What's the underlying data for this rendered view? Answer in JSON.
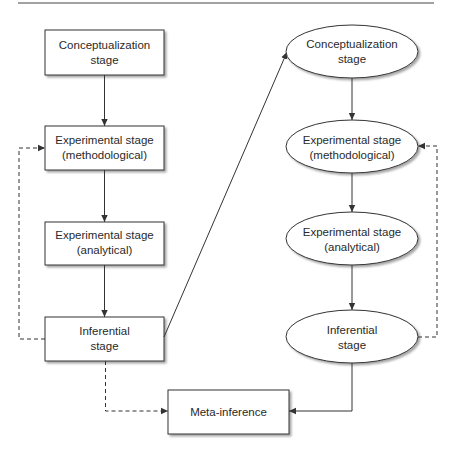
{
  "diagram": {
    "left_column": [
      {
        "line1": "Conceptualization",
        "line2": "stage"
      },
      {
        "line1": "Experimental stage",
        "line2": "(methodological)"
      },
      {
        "line1": "Experimental stage",
        "line2": "(analytical)"
      },
      {
        "line1": "Inferential",
        "line2": "stage"
      }
    ],
    "right_column": [
      {
        "line1": "Conceptualization",
        "line2": "stage"
      },
      {
        "line1": "Experimental stage",
        "line2": "(methodological)"
      },
      {
        "line1": "Experimental stage",
        "line2": "(analytical)"
      },
      {
        "line1": "Inferential",
        "line2": "stage"
      }
    ],
    "meta": {
      "label": "Meta-inference"
    },
    "colors": {
      "stroke": "#333333",
      "shadow": "#c8c8c8",
      "text": "#2a2a2a"
    }
  }
}
